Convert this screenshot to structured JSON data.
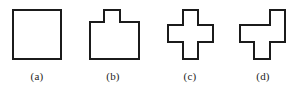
{
  "figure": {
    "background_color": "#ffffff",
    "stroke_color": "#1b1b1b",
    "fill_color": "#ffffff",
    "stroke_width": 2,
    "width": 303,
    "height": 95,
    "panels": [
      {
        "id": "panel-a",
        "caption": "(a)",
        "shape_name": "square",
        "caption_x": 37,
        "caption_y": 70,
        "points": "13,10 61,10 61,59 13,59"
      },
      {
        "id": "panel-b",
        "caption": "(b)",
        "shape_name": "square-with-top-tab",
        "caption_x": 113,
        "caption_y": 70,
        "points": "90,22 104,22 104,10 120,10 120,22 139,22 139,59 90,59"
      },
      {
        "id": "panel-c",
        "caption": "(c)",
        "shape_name": "plus-cross",
        "caption_x": 190,
        "caption_y": 70,
        "points": "183,10 198,10 198,25 213,25 213,42 198,42 198,59 183,59 183,42 168,42 168,25 183,25"
      },
      {
        "id": "panel-d",
        "caption": "(d)",
        "shape_name": "offset-cross",
        "caption_x": 263,
        "caption_y": 70,
        "points": "270,10 285,10 285,42 270,42 270,59 254,59 254,42 240,42 240,25 270,25"
      }
    ]
  }
}
